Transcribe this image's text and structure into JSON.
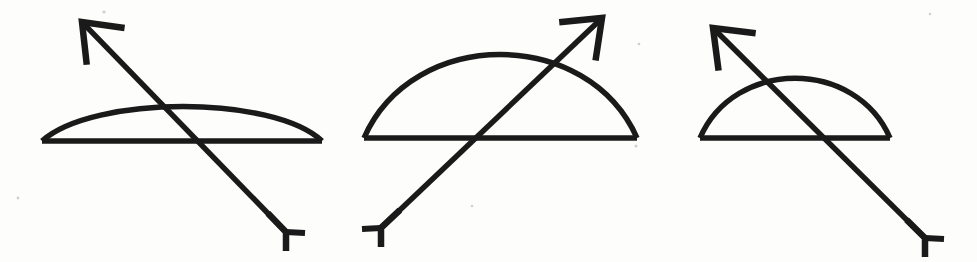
{
  "page": {
    "background_color": "#fdfdfc",
    "ink_color": "#1a1a1a",
    "width": 977,
    "height": 262,
    "figure_count": 3
  },
  "figures": [
    {
      "id": "figure-1",
      "label": "Bow and arrow, shallow arc, arrow pointing upper-left",
      "bow": {
        "string_start_x": 42,
        "string_start_y": 141,
        "string_end_x": 322,
        "string_end_y": 141,
        "arc_apex_x": 186,
        "arc_apex_y": 96,
        "arc_height": 45,
        "span": 280,
        "stroke_width": 5
      },
      "arrow": {
        "tip_x": 82,
        "tip_y": 22,
        "nock_x": 286,
        "nock_y": 232,
        "direction": "upper-left",
        "head_style": "open-v-barb",
        "nock_style": "bracket-fletch",
        "stroke_width": 5,
        "length": 293
      }
    },
    {
      "id": "figure-2",
      "label": "Bow and arrow, tall semicircular arc, arrow pointing upper-right",
      "bow": {
        "string_start_x": 364,
        "string_start_y": 138,
        "string_end_x": 637,
        "string_end_y": 138,
        "arc_apex_x": 500,
        "arc_apex_y": 29,
        "arc_height": 109,
        "span": 273,
        "stroke_width": 5
      },
      "arrow": {
        "tip_x": 602,
        "tip_y": 18,
        "nock_x": 381,
        "nock_y": 228,
        "direction": "upper-right",
        "head_style": "open-v-barb",
        "nock_style": "bracket-fletch",
        "stroke_width": 5,
        "length": 305
      }
    },
    {
      "id": "figure-3",
      "label": "Bow and arrow, medium arc, arrow pointing upper-left",
      "bow": {
        "string_start_x": 700,
        "string_start_y": 138,
        "string_end_x": 890,
        "string_end_y": 138,
        "arc_apex_x": 795,
        "arc_apex_y": 60,
        "arc_height": 78,
        "span": 190,
        "stroke_width": 5
      },
      "arrow": {
        "tip_x": 713,
        "tip_y": 28,
        "nock_x": 925,
        "nock_y": 238,
        "direction": "upper-left",
        "head_style": "open-v-barb",
        "nock_style": "bracket-fletch",
        "stroke_width": 5,
        "length": 298
      }
    }
  ],
  "chart_data": {
    "type": "line",
    "xlabel": "",
    "ylabel": "",
    "series": [
      {
        "name": "figure-1-bow-arc",
        "x": [
          42,
          186,
          322
        ],
        "y": [
          141,
          96,
          141
        ]
      },
      {
        "name": "figure-1-bowstring",
        "x": [
          42,
          322
        ],
        "y": [
          141,
          141
        ]
      },
      {
        "name": "figure-1-arrow",
        "x": [
          286,
          82
        ],
        "y": [
          232,
          22
        ]
      },
      {
        "name": "figure-2-bow-arc",
        "x": [
          364,
          500,
          637
        ],
        "y": [
          138,
          29,
          138
        ]
      },
      {
        "name": "figure-2-bowstring",
        "x": [
          364,
          637
        ],
        "y": [
          138,
          138
        ]
      },
      {
        "name": "figure-2-arrow",
        "x": [
          381,
          602
        ],
        "y": [
          228,
          18
        ]
      },
      {
        "name": "figure-3-bow-arc",
        "x": [
          700,
          795,
          890
        ],
        "y": [
          138,
          60,
          138
        ]
      },
      {
        "name": "figure-3-bowstring",
        "x": [
          700,
          890
        ],
        "y": [
          138,
          138
        ]
      },
      {
        "name": "figure-3-arrow",
        "x": [
          925,
          713
        ],
        "y": [
          238,
          28
        ]
      }
    ],
    "xlim": [
      0,
      977
    ],
    "ylim": [
      262,
      0
    ],
    "grid": false,
    "legend": "none"
  }
}
